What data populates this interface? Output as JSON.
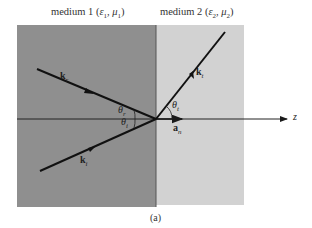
{
  "figure": {
    "medium1": {
      "name": "medium 1",
      "params": "(ε1, μ1)",
      "eps": "ε",
      "eps_sub": "1",
      "mu": "μ",
      "mu_sub": "1",
      "fill": "#8f8f8f"
    },
    "medium2": {
      "name": "medium 2",
      "params": "(ε2, μ2)",
      "eps": "ε",
      "eps_sub": "2",
      "mu": "μ",
      "mu_sub": "2",
      "fill": "#cfcfcf"
    },
    "vectors": {
      "reflected": {
        "symbol": "k",
        "subscript": "r"
      },
      "incident": {
        "symbol": "k",
        "subscript": "i"
      },
      "transmitted": {
        "symbol": "k",
        "subscript": "t"
      },
      "normal": {
        "symbol": "a",
        "subscript": "n"
      }
    },
    "angles": {
      "reflection": {
        "symbol": "θ",
        "subscript": "r"
      },
      "incidence": {
        "symbol": "θ",
        "subscript": "i"
      },
      "transmission": {
        "symbol": "θ",
        "subscript": "t"
      }
    },
    "axis_label": "z",
    "caption": "(a)"
  }
}
